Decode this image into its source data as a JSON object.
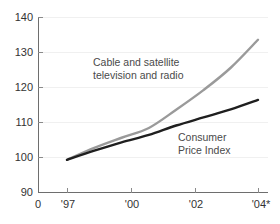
{
  "chart_data": {
    "type": "line",
    "title": "",
    "subtitle": "",
    "xlabel": "",
    "ylabel": "",
    "xlim": [
      1996.3,
      2004.6
    ],
    "ylim": [
      90,
      140
    ],
    "grid": true,
    "legend_position": "inline-annotations",
    "y_ticks": [
      "140",
      "130",
      "120",
      "110",
      "100",
      "90"
    ],
    "y_tick_values": [
      140,
      130,
      120,
      110,
      100,
      90
    ],
    "x_ticks": [
      "0",
      "'97",
      "'00",
      "'02",
      "'04*"
    ],
    "x_tick_values": [
      1996.3,
      1997,
      2000,
      2002,
      2004
    ],
    "origin_label": "0",
    "x": [
      1997,
      1998,
      1999,
      2000,
      2001,
      2002,
      2003,
      2004
    ],
    "series": [
      {
        "name": "Cable and satellite television and radio",
        "label_lines": [
          "Cable and satellite",
          "television and radio"
        ],
        "color": "#9a9a9a",
        "values": [
          99.2,
          102.6,
          105.5,
          108.3,
          113.5,
          119.1,
          125.5,
          133.5
        ]
      },
      {
        "name": "Consumer Price Index",
        "label_lines": [
          "Consumer",
          "Price Index"
        ],
        "color": "#1f1f1f",
        "values": [
          99.2,
          101.8,
          104.2,
          106.3,
          109.0,
          111.3,
          113.6,
          116.3
        ]
      }
    ],
    "annotations": [
      {
        "id": "cable-label",
        "lines": [
          "Cable and satellite",
          "television and radio"
        ],
        "x": 151,
        "y": 66
      },
      {
        "id": "cpi-label",
        "lines": [
          "Consumer",
          "Price Index"
        ],
        "x": 207,
        "y": 141
      }
    ],
    "footnote": ""
  },
  "axes": {
    "y_tick_labels": [
      {
        "text": "140",
        "y": 17
      },
      {
        "text": "130",
        "y": 52
      },
      {
        "text": "120",
        "y": 87
      },
      {
        "text": "110",
        "y": 122
      },
      {
        "text": "100",
        "y": 157
      }
    ],
    "y_bottom_label": {
      "text": "90",
      "y": 192
    },
    "x_tick_labels": [
      {
        "text": "0",
        "x": 38
      },
      {
        "text": "'97",
        "x": 67
      },
      {
        "text": "'00",
        "x": 131
      },
      {
        "text": "'02",
        "x": 195
      },
      {
        "text": "'04*",
        "x": 260
      }
    ]
  },
  "colors": {
    "background": "#ffffff",
    "axis": "#6e6e6e",
    "grid": "#f0f0f0",
    "text": "#333333",
    "series_cable": "#9a9a9a",
    "series_cpi": "#1f1f1f"
  }
}
